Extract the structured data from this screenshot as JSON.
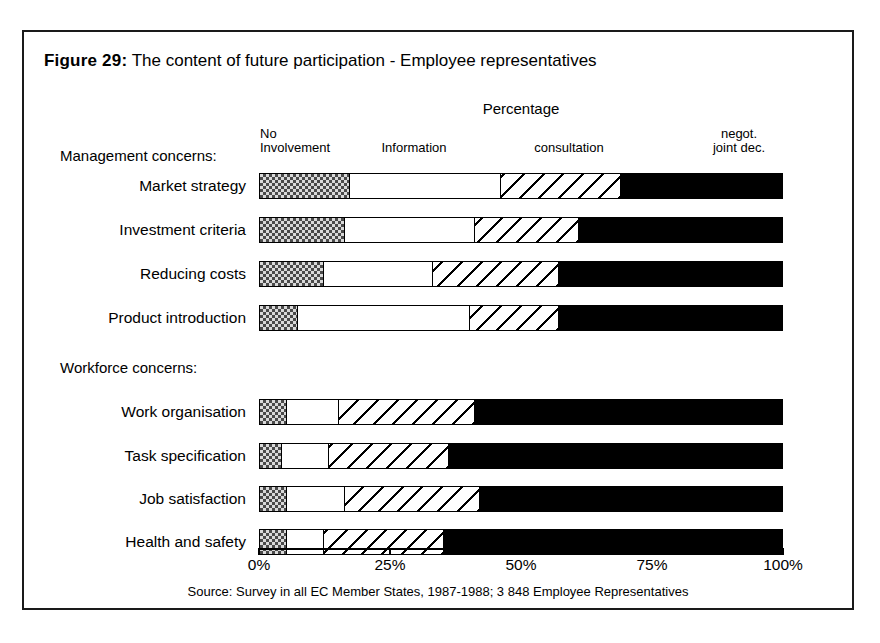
{
  "figure": {
    "number_label": "Figure 29:",
    "title": "The content of future participation - Employee representatives",
    "axis_title": "Percentage",
    "source": "Source: Survey in all EC Member States, 1987-1988; 3 848 Employee Representatives"
  },
  "legend": {
    "no_involvement": "No\nInvolvement",
    "no_involvement_line1": "No",
    "no_involvement_line2": "Involvement",
    "information": "Information",
    "consultation": "consultation",
    "negot_line1": "negot.",
    "negot_line2": "joint dec."
  },
  "groups": {
    "management": "Management concerns:",
    "workforce": "Workforce concerns:"
  },
  "axis": {
    "ticks": [
      "0%",
      "25%",
      "50%",
      "75%",
      "100%"
    ],
    "tick_values": [
      0,
      25,
      50,
      75,
      100
    ]
  },
  "colors": {
    "frame": "#1a1a1a",
    "no_involvement": "#d9d9d9",
    "information": "#ffffff",
    "consultation": "#ffffff",
    "negot_joint_dec": "#000000",
    "text": "#000000"
  },
  "chart_data": {
    "type": "bar",
    "orientation": "horizontal",
    "stacked": true,
    "normalized_percent": true,
    "title": "Figure 29: The content of future participation - Employee representatives",
    "subtitle": "Percentage",
    "xlabel": "Percentage",
    "ylabel": "",
    "xlim": [
      0,
      100
    ],
    "xticks": [
      0,
      25,
      50,
      75,
      100
    ],
    "xticklabels": [
      "0%",
      "25%",
      "50%",
      "75%",
      "100%"
    ],
    "grid": false,
    "legend_position": "top",
    "legend": [
      "No Involvement",
      "Information",
      "consultation",
      "negot. joint dec."
    ],
    "categories": [
      "Market strategy",
      "Investment criteria",
      "Reducing costs",
      "Product introduction",
      "Work organisation",
      "Task specification",
      "Job satisfaction",
      "Health and safety"
    ],
    "category_groups": [
      {
        "name": "Management concerns:",
        "categories": [
          "Market strategy",
          "Investment criteria",
          "Reducing costs",
          "Product introduction"
        ]
      },
      {
        "name": "Workforce concerns:",
        "categories": [
          "Work organisation",
          "Task specification",
          "Job satisfaction",
          "Health and safety"
        ]
      }
    ],
    "series": [
      {
        "name": "No Involvement",
        "values": [
          17,
          16,
          12,
          7,
          5,
          4,
          5,
          5
        ]
      },
      {
        "name": "Information",
        "values": [
          29,
          25,
          21,
          33,
          10,
          9,
          11,
          7
        ]
      },
      {
        "name": "consultation",
        "values": [
          23,
          20,
          24,
          17,
          26,
          23,
          26,
          23
        ]
      },
      {
        "name": "negot. joint dec.",
        "values": [
          31,
          39,
          43,
          43,
          59,
          64,
          58,
          65
        ]
      }
    ],
    "source": "Source: Survey in all EC Member States, 1987-1988; 3 848 Employee Representatives"
  },
  "rows": [
    {
      "label": "Market strategy",
      "top": 141,
      "segments": [
        17,
        29,
        23,
        31
      ]
    },
    {
      "label": "Investment criteria",
      "top": 185,
      "segments": [
        16,
        25,
        20,
        39
      ]
    },
    {
      "label": "Reducing costs",
      "top": 229,
      "segments": [
        12,
        21,
        24,
        43
      ]
    },
    {
      "label": "Product introduction",
      "top": 273,
      "segments": [
        7,
        33,
        17,
        43
      ]
    },
    {
      "label": "Work organisation",
      "top": 367,
      "segments": [
        5,
        10,
        26,
        59
      ]
    },
    {
      "label": "Task specification",
      "top": 411,
      "segments": [
        4,
        9,
        23,
        64
      ]
    },
    {
      "label": "Job satisfaction",
      "top": 454,
      "segments": [
        5,
        11,
        26,
        58
      ]
    },
    {
      "label": "Health and safety",
      "top": 497,
      "segments": [
        5,
        7,
        23,
        65
      ]
    }
  ]
}
